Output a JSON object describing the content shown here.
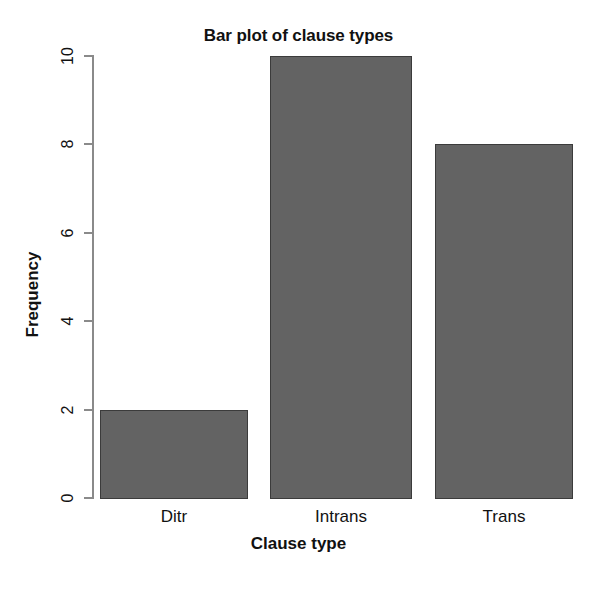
{
  "chart_data": {
    "type": "bar",
    "title": "Bar plot of clause types",
    "xlabel": "Clause type",
    "ylabel": "Frequency",
    "categories": [
      "Ditr",
      "Intrans",
      "Trans"
    ],
    "values": [
      2,
      10,
      8
    ],
    "ylim": [
      0,
      10
    ],
    "yticks": [
      0,
      2,
      4,
      6,
      8,
      10
    ],
    "ytick_labels": [
      "0",
      "2",
      "4",
      "6",
      "8",
      "10"
    ],
    "grid": false,
    "legend": false,
    "bar_color": "#636363",
    "bar_border_color": "#3b3b3b",
    "axis_color": "#8a8a8a",
    "background": "#ffffff",
    "tick_label_rotation": 90,
    "series": [
      {
        "name": "Frequency",
        "values": [
          2,
          10,
          8
        ]
      }
    ]
  }
}
